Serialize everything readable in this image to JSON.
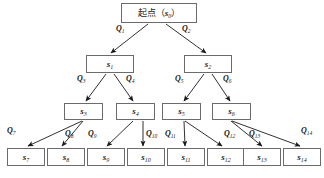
{
  "diagram": {
    "type": "tree-diagram",
    "colors": {
      "box_border": "#6b6b6b",
      "box_fill": "#ffffff",
      "edge": "#1a1a1a",
      "text": "#1a1a1a",
      "background": "#ffffff"
    },
    "nodes": [
      {
        "id": "s0",
        "label_prefix": "起点（",
        "label_sym": "s",
        "label_sub": "0",
        "label_suffix": "）",
        "full_label": "起点（s0）",
        "level": 0,
        "x": 121,
        "y": 3,
        "w": 76,
        "h": 20
      },
      {
        "id": "s1",
        "label_sym": "s",
        "label_sub": "1",
        "full_label": "s1",
        "level": 1,
        "x": 86,
        "y": 55,
        "w": 48,
        "h": 18
      },
      {
        "id": "s2",
        "label_sym": "s",
        "label_sub": "2",
        "full_label": "s2",
        "level": 1,
        "x": 184,
        "y": 55,
        "w": 48,
        "h": 18
      },
      {
        "id": "s3",
        "label_sym": "s",
        "label_sub": "3",
        "full_label": "s3",
        "level": 2,
        "x": 64,
        "y": 103,
        "w": 39,
        "h": 17
      },
      {
        "id": "s4",
        "label_sym": "s",
        "label_sub": "4",
        "full_label": "s4",
        "level": 2,
        "x": 116,
        "y": 103,
        "w": 39,
        "h": 17
      },
      {
        "id": "s5",
        "label_sym": "s",
        "label_sub": "5",
        "full_label": "s5",
        "level": 2,
        "x": 162,
        "y": 103,
        "w": 39,
        "h": 17
      },
      {
        "id": "s6",
        "label_sym": "s",
        "label_sub": "6",
        "full_label": "s6",
        "level": 2,
        "x": 212,
        "y": 103,
        "w": 39,
        "h": 17
      },
      {
        "id": "s7",
        "label_sym": "s",
        "label_sub": "7",
        "full_label": "s7",
        "level": 3,
        "x": 7,
        "y": 148,
        "w": 38,
        "h": 18
      },
      {
        "id": "s8",
        "label_sym": "s",
        "label_sub": "8",
        "full_label": "s8",
        "level": 3,
        "x": 47,
        "y": 148,
        "w": 38,
        "h": 18
      },
      {
        "id": "s9",
        "label_sym": "s",
        "label_sub": "9",
        "full_label": "s9",
        "level": 3,
        "x": 87,
        "y": 148,
        "w": 38,
        "h": 18
      },
      {
        "id": "s10",
        "label_sym": "s",
        "label_sub": "10",
        "full_label": "s10",
        "level": 3,
        "x": 127,
        "y": 148,
        "w": 38,
        "h": 18
      },
      {
        "id": "s11",
        "label_sym": "s",
        "label_sub": "11",
        "full_label": "s11",
        "level": 3,
        "x": 167,
        "y": 148,
        "w": 38,
        "h": 18
      },
      {
        "id": "s12",
        "label_sym": "s",
        "label_sub": "12",
        "full_label": "s12",
        "level": 3,
        "x": 207,
        "y": 148,
        "w": 38,
        "h": 18
      },
      {
        "id": "s13",
        "label_sym": "s",
        "label_sub": "13",
        "full_label": "s13",
        "level": 3,
        "x": 243,
        "y": 148,
        "w": 38,
        "h": 18
      },
      {
        "id": "s14",
        "label_sym": "s",
        "label_sub": "14",
        "full_label": "s14",
        "level": 3,
        "x": 283,
        "y": 148,
        "w": 38,
        "h": 18
      }
    ],
    "edges": [
      {
        "id": "e1",
        "from": "s0",
        "to": "s1",
        "label_sym": "Q",
        "label_sub": "1",
        "full_label": "Q1",
        "x1": 148,
        "y1": 24,
        "x2": 111,
        "y2": 53,
        "lx": 116,
        "ly": 25
      },
      {
        "id": "e2",
        "from": "s0",
        "to": "s2",
        "label_sym": "Q",
        "label_sub": "2",
        "full_label": "Q2",
        "x1": 166,
        "y1": 24,
        "x2": 206,
        "y2": 53,
        "lx": 182,
        "ly": 25
      },
      {
        "id": "e3",
        "from": "s1",
        "to": "s3",
        "label_sym": "Q",
        "label_sub": "3",
        "full_label": "Q3",
        "x1": 106,
        "y1": 74,
        "x2": 86,
        "y2": 101,
        "lx": 77,
        "ly": 75
      },
      {
        "id": "e4",
        "from": "s1",
        "to": "s4",
        "label_sym": "Q",
        "label_sub": "4",
        "full_label": "Q4",
        "x1": 114,
        "y1": 74,
        "x2": 133,
        "y2": 101,
        "lx": 126,
        "ly": 75
      },
      {
        "id": "e5",
        "from": "s2",
        "to": "s5",
        "label_sym": "Q",
        "label_sub": "5",
        "full_label": "Q5",
        "x1": 204,
        "y1": 74,
        "x2": 184,
        "y2": 101,
        "lx": 175,
        "ly": 75
      },
      {
        "id": "e6",
        "from": "s2",
        "to": "s6",
        "label_sym": "Q",
        "label_sub": "6",
        "full_label": "Q6",
        "x1": 212,
        "y1": 74,
        "x2": 230,
        "y2": 101,
        "lx": 223,
        "ly": 75
      },
      {
        "id": "e7",
        "from": "s3",
        "to": "s7",
        "label_sym": "Q",
        "label_sub": "7",
        "full_label": "Q7",
        "x1": 82,
        "y1": 121,
        "x2": 28,
        "y2": 146,
        "lx": 7,
        "ly": 127
      },
      {
        "id": "e8",
        "from": "s3",
        "to": "s8",
        "label_sym": "Q",
        "label_sub": "8",
        "full_label": "Q8",
        "x1": 83,
        "y1": 121,
        "x2": 62,
        "y2": 146,
        "lx": 65,
        "ly": 130
      },
      {
        "id": "e9",
        "from": "s4",
        "to": "s9",
        "label_sym": "Q",
        "label_sub": "9",
        "full_label": "Q9",
        "x1": 133,
        "y1": 121,
        "x2": 107,
        "y2": 146,
        "lx": 88,
        "ly": 130
      },
      {
        "id": "e10",
        "from": "s4",
        "to": "s10",
        "label_sym": "Q",
        "label_sub": "10",
        "full_label": "Q10",
        "x1": 143,
        "y1": 121,
        "x2": 143,
        "y2": 146,
        "lx": 146,
        "ly": 130
      },
      {
        "id": "e11",
        "from": "s5",
        "to": "s11",
        "label_sym": "Q",
        "label_sub": "11",
        "full_label": "Q11",
        "x1": 184,
        "y1": 121,
        "x2": 185,
        "y2": 146,
        "lx": 165,
        "ly": 130
      },
      {
        "id": "e12",
        "from": "s5",
        "to": "s12",
        "label_sym": "Q",
        "label_sub": "12",
        "full_label": "Q12",
        "x1": 185,
        "y1": 121,
        "x2": 222,
        "y2": 146,
        "lx": 224,
        "ly": 130
      },
      {
        "id": "e13",
        "from": "s6",
        "to": "s13",
        "label_sym": "Q",
        "label_sub": "13",
        "full_label": "Q13",
        "x1": 231,
        "y1": 121,
        "x2": 262,
        "y2": 146,
        "lx": 249,
        "ly": 130
      },
      {
        "id": "e14",
        "from": "s6",
        "to": "s14",
        "label_sym": "Q",
        "label_sub": "14",
        "full_label": "Q14",
        "x1": 232,
        "y1": 121,
        "x2": 300,
        "y2": 146,
        "lx": 301,
        "ly": 127
      }
    ]
  }
}
